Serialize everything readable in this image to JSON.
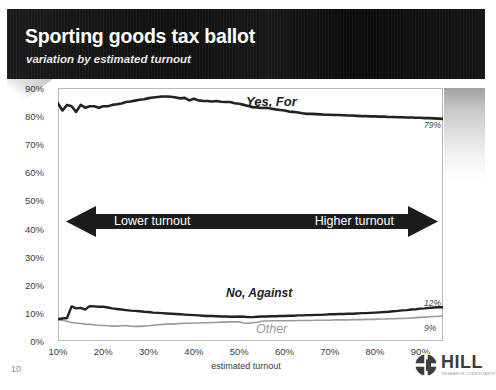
{
  "slide": {
    "title": "Sporting goods tax ballot",
    "subtitle": "variation by estimated turnout",
    "page_number": "10"
  },
  "annotation": {
    "left_text": "Lower turnout",
    "right_text": "Higher turnout"
  },
  "logo": {
    "name": "HILL",
    "tagline": "RESEARCH CONSULTANTS",
    "mark": "hill-circle-icon"
  },
  "colors": {
    "header_band": "#111111",
    "series_primary": "#222222",
    "series_secondary": "#222222",
    "series_other": "#9a9a9a",
    "axis_text": "#3a3a3a",
    "frame": "#b9b9b9"
  },
  "chart_data": {
    "type": "line",
    "title": "Sporting goods tax ballot",
    "subtitle": "variation by estimated turnout",
    "xlabel": "estimated turnout",
    "ylabel": "",
    "xlim": [
      10,
      95
    ],
    "ylim": [
      0,
      90
    ],
    "grid": false,
    "legend": "inline-labels",
    "xticks": [
      "10%",
      "20%",
      "30%",
      "40%",
      "50%",
      "60%",
      "70%",
      "80%",
      "90%"
    ],
    "xtick_values": [
      10,
      20,
      30,
      40,
      50,
      60,
      70,
      80,
      90
    ],
    "yticks": [
      "0%",
      "10%",
      "20%",
      "30%",
      "40%",
      "50%",
      "60%",
      "70%",
      "80%",
      "90%"
    ],
    "ytick_values": [
      0,
      10,
      20,
      30,
      40,
      50,
      60,
      70,
      80,
      90
    ],
    "x": [
      10,
      11,
      12,
      13,
      14,
      15,
      16,
      17,
      18,
      19,
      20,
      21,
      22,
      23,
      24,
      25,
      26,
      27,
      28,
      29,
      30,
      31,
      32,
      33,
      34,
      35,
      36,
      37,
      38,
      39,
      40,
      41,
      42,
      43,
      44,
      45,
      46,
      47,
      48,
      49,
      50,
      51,
      52,
      53,
      54,
      55,
      56,
      57,
      58,
      59,
      60,
      61,
      62,
      63,
      64,
      65,
      66,
      67,
      68,
      69,
      70,
      71,
      72,
      73,
      74,
      75,
      76,
      77,
      78,
      79,
      80,
      81,
      82,
      83,
      84,
      85,
      86,
      87,
      88,
      89,
      90,
      91,
      92,
      93,
      94,
      95
    ],
    "series": [
      {
        "name": "Yes, For",
        "label": "Yes, For",
        "end_label": "79%",
        "color": "#222222",
        "width": 2.6,
        "values": [
          84.5,
          82.0,
          84.0,
          83.5,
          81.5,
          84.0,
          83.0,
          83.5,
          83.5,
          83.0,
          83.5,
          83.5,
          84.0,
          84.2,
          84.5,
          85.0,
          85.2,
          85.5,
          85.8,
          86.0,
          86.4,
          86.6,
          86.8,
          87.0,
          87.0,
          86.9,
          86.6,
          86.3,
          86.5,
          85.6,
          86.2,
          85.6,
          85.4,
          85.4,
          85.2,
          85.4,
          85.1,
          85.0,
          85.0,
          84.6,
          84.4,
          84.0,
          83.6,
          83.2,
          83.1,
          82.9,
          83.0,
          82.7,
          82.4,
          82.2,
          82.0,
          81.6,
          81.5,
          81.3,
          81.0,
          80.8,
          80.8,
          80.7,
          80.6,
          80.5,
          80.5,
          80.4,
          80.4,
          80.3,
          80.2,
          80.2,
          80.1,
          80.0,
          80.0,
          79.9,
          79.9,
          79.8,
          79.8,
          79.7,
          79.7,
          79.6,
          79.6,
          79.5,
          79.5,
          79.4,
          79.4,
          79.3,
          79.3,
          79.2,
          79.1,
          79.0
        ]
      },
      {
        "name": "No, Against",
        "label": "No, Against",
        "end_label": "12%",
        "color": "#222222",
        "width": 2.4,
        "values": [
          7.8,
          8.0,
          8.2,
          12.3,
          11.6,
          11.8,
          11.2,
          12.4,
          12.3,
          12.2,
          12.2,
          11.9,
          11.6,
          11.4,
          11.2,
          11.0,
          10.8,
          10.7,
          10.6,
          10.4,
          10.3,
          10.1,
          10.0,
          9.9,
          9.8,
          9.7,
          9.6,
          9.5,
          9.4,
          9.3,
          9.2,
          9.1,
          9.0,
          8.9,
          8.9,
          8.8,
          8.7,
          8.7,
          8.6,
          8.6,
          8.7,
          8.6,
          8.5,
          8.5,
          8.6,
          8.7,
          8.7,
          8.8,
          8.8,
          8.9,
          8.9,
          9.0,
          9.0,
          9.1,
          9.1,
          9.2,
          9.2,
          9.3,
          9.3,
          9.4,
          9.5,
          9.5,
          9.6,
          9.6,
          9.7,
          9.7,
          9.8,
          9.9,
          9.9,
          10.0,
          10.1,
          10.2,
          10.3,
          10.4,
          10.6,
          10.7,
          10.9,
          11.0,
          11.2,
          11.3,
          11.5,
          11.6,
          11.8,
          11.9,
          12.0,
          12.0
        ]
      },
      {
        "name": "Other",
        "label": "Other",
        "end_label": "9%",
        "color": "#9a9a9a",
        "width": 1.6,
        "values": [
          7.6,
          7.3,
          7.0,
          6.6,
          6.4,
          6.2,
          6.0,
          5.9,
          5.8,
          5.6,
          5.5,
          5.4,
          5.3,
          5.3,
          5.4,
          5.5,
          5.3,
          5.2,
          5.2,
          5.3,
          5.4,
          5.6,
          5.8,
          5.9,
          6.0,
          6.0,
          6.1,
          6.2,
          6.3,
          6.3,
          6.4,
          6.4,
          6.5,
          6.5,
          6.6,
          6.6,
          6.7,
          6.7,
          6.8,
          6.8,
          6.8,
          6.4,
          6.3,
          6.5,
          6.7,
          7.0,
          7.1,
          7.2,
          7.2,
          7.2,
          7.2,
          7.2,
          7.2,
          7.3,
          7.3,
          7.3,
          7.3,
          7.4,
          7.4,
          7.4,
          7.4,
          7.5,
          7.5,
          7.5,
          7.5,
          7.6,
          7.6,
          7.6,
          7.7,
          7.7,
          7.7,
          7.8,
          7.8,
          7.9,
          7.9,
          8.0,
          8.0,
          8.1,
          8.2,
          8.3,
          8.4,
          8.5,
          8.6,
          8.7,
          8.8,
          9.0
        ]
      }
    ]
  }
}
